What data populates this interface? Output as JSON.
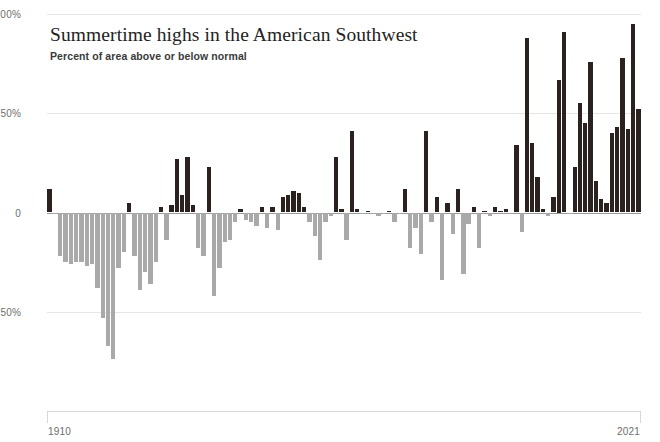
{
  "chart_data": {
    "type": "bar",
    "title": "Summertime highs in the American Southwest",
    "subtitle": "Percent of area above or below normal",
    "xlabel": "",
    "ylabel": "",
    "ylim": [
      -100,
      100
    ],
    "xlim": [
      1910,
      2021
    ],
    "grid": true,
    "legend": "none",
    "yticks": [
      {
        "value": 100,
        "label": "100%"
      },
      {
        "value": 50,
        "label": "50%"
      },
      {
        "value": 0,
        "label": "0"
      },
      {
        "value": -50,
        "label": "50%"
      }
    ],
    "xticks": [
      {
        "value": 1910,
        "label": "1910"
      },
      {
        "value": 2021,
        "label": "2021"
      }
    ],
    "colors": {
      "positive": "#2b2220",
      "negative": "#a9a9a9",
      "gridline": "#e6e6e6",
      "zero_line": "#9a9a9a",
      "axis": "#d8d8d8",
      "title": "#232323",
      "tick_label": "#6d6d6d"
    },
    "series_name": "Percent of area above or below normal",
    "categories": [
      1910,
      1911,
      1912,
      1913,
      1914,
      1915,
      1916,
      1917,
      1918,
      1919,
      1920,
      1921,
      1922,
      1923,
      1924,
      1925,
      1926,
      1927,
      1928,
      1929,
      1930,
      1931,
      1932,
      1933,
      1934,
      1935,
      1936,
      1937,
      1938,
      1939,
      1940,
      1941,
      1942,
      1943,
      1944,
      1945,
      1946,
      1947,
      1948,
      1949,
      1950,
      1951,
      1952,
      1953,
      1954,
      1955,
      1956,
      1957,
      1958,
      1959,
      1960,
      1961,
      1962,
      1963,
      1964,
      1965,
      1966,
      1967,
      1968,
      1969,
      1970,
      1971,
      1972,
      1973,
      1974,
      1975,
      1976,
      1977,
      1978,
      1979,
      1980,
      1981,
      1982,
      1983,
      1984,
      1985,
      1986,
      1987,
      1988,
      1989,
      1990,
      1991,
      1992,
      1993,
      1994,
      1995,
      1996,
      1997,
      1998,
      1999,
      2000,
      2001,
      2002,
      2003,
      2004,
      2005,
      2006,
      2007,
      2008,
      2009,
      2010,
      2011,
      2012,
      2013,
      2014,
      2015,
      2016,
      2017,
      2018,
      2019,
      2020,
      2021
    ],
    "values": [
      12,
      -1,
      -22,
      -25,
      -26,
      -25,
      -25,
      -27,
      -26,
      -38,
      -53,
      -67,
      -74,
      -28,
      -20,
      5,
      -22,
      -39,
      -30,
      -36,
      -25,
      3,
      -14,
      4,
      27,
      9,
      28,
      4,
      -18,
      -22,
      23,
      -42,
      -28,
      -15,
      -14,
      -5,
      2,
      -4,
      -5,
      -7,
      3,
      -8,
      3,
      -9,
      8,
      9,
      11,
      10,
      3,
      -5,
      -12,
      -24,
      -5,
      -2,
      28,
      2,
      -14,
      41,
      2,
      -1,
      1,
      -1,
      -2,
      -1,
      1,
      -5,
      -1,
      12,
      -18,
      -8,
      -21,
      41,
      -5,
      8,
      -34,
      5,
      -11,
      12,
      -31,
      -6,
      3,
      -18,
      1,
      -2,
      3,
      1,
      2,
      -1,
      34,
      -10,
      88,
      35,
      18,
      2,
      -2,
      8,
      67,
      91,
      -1,
      23,
      55,
      45,
      76,
      16,
      7,
      5,
      40,
      43,
      78,
      42,
      95,
      52
    ]
  }
}
